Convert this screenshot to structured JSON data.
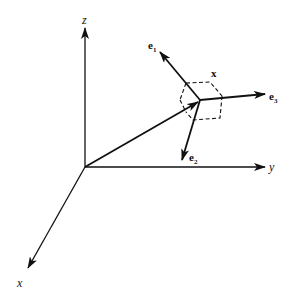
{
  "diagram": {
    "axes": {
      "z": {
        "label": "z"
      },
      "y": {
        "label": "y"
      },
      "x": {
        "label": "x"
      }
    },
    "point": {
      "label": "x"
    },
    "basis": {
      "e1": {
        "base": "e",
        "sub": "1"
      },
      "e2": {
        "base": "e",
        "sub": "2"
      },
      "e3": {
        "base": "e",
        "sub": "3"
      }
    },
    "colors": {
      "stroke": "#111111",
      "background": "#ffffff"
    }
  }
}
